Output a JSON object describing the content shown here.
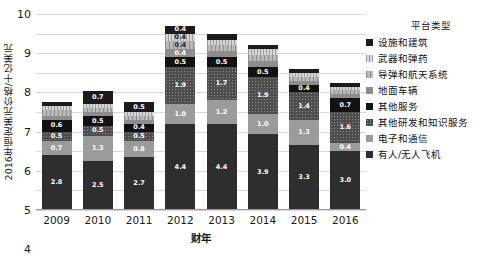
{
  "chart_data": {
    "type": "bar",
    "stacked": true,
    "title": "",
    "xlabel": "财年",
    "ylabel": "2016年恒定美元价格/十亿美元",
    "legend_title": "平台类型",
    "legend_position": "right",
    "grid": true,
    "ylim": [
      0,
      10
    ],
    "yticks": [
      0,
      1,
      2,
      3,
      4,
      5,
      6,
      7,
      8,
      9,
      10
    ],
    "categories": [
      "2009",
      "2010",
      "2011",
      "2012",
      "2013",
      "2014",
      "2015",
      "2016"
    ],
    "series": [
      {
        "name": "有人/无人飞机",
        "style": "s-aircraft",
        "color": "#2e2e2e",
        "values": [
          2.8,
          2.5,
          2.7,
          4.4,
          4.4,
          3.9,
          3.3,
          3.0
        ],
        "labels": [
          "2.8",
          "2.5",
          "2.7",
          "4.4",
          "4.4",
          "3.9",
          "3.3",
          "3.0"
        ]
      },
      {
        "name": "电子和通信",
        "style": "s-electronics",
        "color": "#9b9b9b",
        "values": [
          0.7,
          1.3,
          0.8,
          1.0,
          1.2,
          1.0,
          1.3,
          0.4
        ],
        "labels": [
          "0.7",
          "1.3",
          "0.8",
          "1.0",
          "1.2",
          "1.0",
          "1.3",
          "0.4"
        ]
      },
      {
        "name": "其他研发和知识服务",
        "style": "s-rnd",
        "color": "#4e4e4e",
        "values": [
          0.5,
          0.5,
          0.5,
          1.9,
          1.7,
          1.9,
          1.4,
          1.6
        ],
        "labels": [
          "0.5",
          "0.5",
          "0.5",
          "1.9",
          "1.7",
          "1.9",
          "1.4",
          "1.6"
        ]
      },
      {
        "name": "其他服务",
        "style": "s-otherserv",
        "color": "#121212",
        "values": [
          0.6,
          0.5,
          0.4,
          0.5,
          0.5,
          0.5,
          0.4,
          0.7
        ],
        "labels": [
          "0.6",
          "0.5",
          "0.4",
          "0.5",
          "0.5",
          "0.5",
          "0.4",
          "0.7"
        ]
      },
      {
        "name": "地面车辆",
        "style": "s-ground",
        "color": "#8d8d8d",
        "values": [
          0.2,
          0.2,
          0.2,
          0.4,
          0.3,
          0.3,
          0.2,
          0.2
        ],
        "labels": [
          "0.2",
          "0.2",
          "0.2",
          "0.4",
          "0.3",
          "0.3",
          "0.2",
          "0.2"
        ]
      },
      {
        "name": "导弹和航天系统",
        "style": "s-missile",
        "color": "#b9b9b9",
        "values": [
          0.3,
          0.2,
          0.2,
          0.4,
          0.3,
          0.3,
          0.2,
          0.2
        ],
        "labels": [
          "0.3",
          "0.2",
          "0.2",
          "0.4",
          "0.3",
          "0.3",
          "0.2",
          "0.2"
        ]
      },
      {
        "name": "武器和弹药",
        "style": "s-weapons",
        "color": "#d8d8d8",
        "values": [
          0.2,
          0.2,
          0.2,
          0.4,
          0.3,
          0.3,
          0.2,
          0.2
        ],
        "labels": [
          "0.2",
          "0.2",
          "0.2",
          "0.4",
          "0.3",
          "0.3",
          "0.2",
          "0.2"
        ]
      },
      {
        "name": "设施和建筑",
        "style": "s-facilities",
        "color": "#1b1b1b",
        "values": [
          0.2,
          0.7,
          0.5,
          0.4,
          0.3,
          0.2,
          0.2,
          0.2
        ],
        "labels": [
          "0.2",
          "0.7",
          "0.5",
          "0.4",
          "0.3",
          "0.2",
          "0.2",
          "0.2"
        ]
      }
    ],
    "legend_order": [
      "设施和建筑",
      "武器和弹药",
      "导弹和航天系统",
      "地面车辆",
      "其他服务",
      "其他研发和知识服务",
      "电子和通信",
      "有人/无人飞机"
    ]
  }
}
